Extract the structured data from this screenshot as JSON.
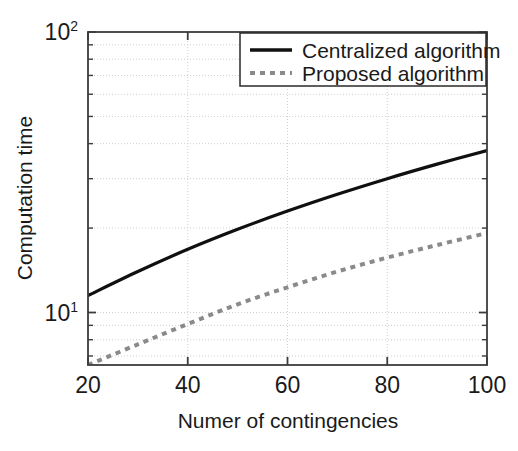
{
  "chart_data": {
    "type": "line",
    "title": "",
    "xlabel": "Numer of contingencies",
    "ylabel": "Computation time",
    "xlim": [
      20,
      100
    ],
    "ylim": [
      6.5,
      100
    ],
    "yscale": "log",
    "xscale": "linear",
    "grid": true,
    "grid_style": "dotted",
    "legend_position": "top-right",
    "xticks": [
      20,
      40,
      60,
      80,
      100
    ],
    "xtick_labels": [
      "20",
      "40",
      "60",
      "80",
      "100"
    ],
    "yticks": [
      10,
      100
    ],
    "ytick_labels": [
      "10¹",
      "10²"
    ],
    "ytick_bases": [
      "10",
      "10"
    ],
    "ytick_exponents": [
      "1",
      "2"
    ],
    "x": [
      20,
      30,
      40,
      50,
      60,
      70,
      80,
      90,
      100
    ],
    "series": [
      {
        "name": "Centralized algorithm",
        "style": "solid",
        "color": "#101010",
        "width": 3.2,
        "values": [
          11.5,
          14.0,
          16.8,
          19.8,
          23.0,
          26.4,
          30.0,
          33.8,
          37.8
        ]
      },
      {
        "name": "Proposed algorithm",
        "style": "dotted",
        "color": "#8a8a8a",
        "width": 4.0,
        "values": [
          6.5,
          7.7,
          9.1,
          10.7,
          12.3,
          14.0,
          15.7,
          17.4,
          19.2
        ]
      }
    ]
  },
  "axes": {
    "x_title": "Numer of contingencies",
    "y_title": "Computation time",
    "x_tick_labels": [
      "20",
      "40",
      "60",
      "80",
      "100"
    ],
    "y_top_base": "10",
    "y_top_exp": "2",
    "y_bottom_base": "10",
    "y_bottom_exp": "1"
  },
  "legend": {
    "items": [
      {
        "label": "Centralized algorithm",
        "style": "solid",
        "color": "#101010"
      },
      {
        "label": "Proposed algorithm",
        "style": "dotted",
        "color": "#8a8a8a"
      }
    ]
  },
  "colors": {
    "axis": "#3c3c3c",
    "grid": "#c8c8c8",
    "centralized": "#101010",
    "proposed": "#8a8a8a",
    "background": "#ffffff"
  }
}
